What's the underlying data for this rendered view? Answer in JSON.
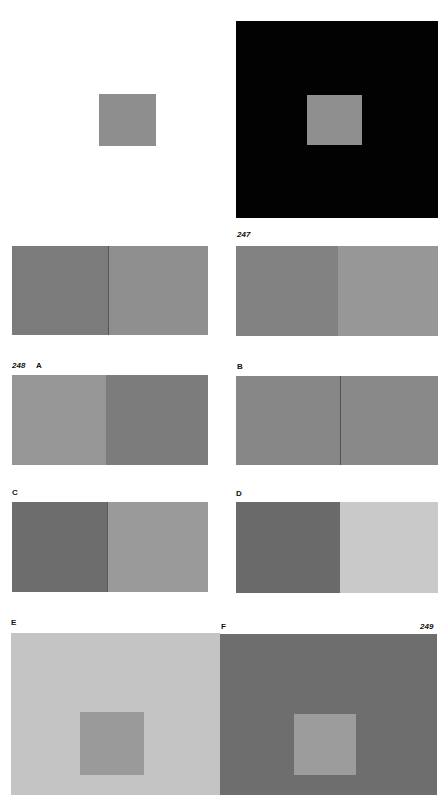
{
  "page_numbers": {
    "p247": "247",
    "p248": "248",
    "p249": "249"
  },
  "labels": {
    "A": "A",
    "B": "B",
    "C": "C",
    "D": "D",
    "E": "E",
    "F": "F"
  },
  "figures": {
    "top_left": {
      "background": "#ffffff",
      "square": "#8e8e8e"
    },
    "top_right": {
      "background": "#020202",
      "square": "#8f8f8f"
    },
    "row1_left": {
      "left": "#7b7b7b",
      "right": "#8f8f8f"
    },
    "row1_right": {
      "left": "#828282",
      "right": "#979797"
    },
    "A": {
      "left": "#969696",
      "right": "#7c7c7c"
    },
    "B": {
      "left": "#878787",
      "right": "#898989"
    },
    "C": {
      "left": "#6d6d6d",
      "right": "#9a9a9a"
    },
    "D": {
      "left": "#6a6a6a",
      "right": "#c9c9c9"
    },
    "E": {
      "background": "#c4c4c4",
      "square": "#9a9a9a"
    },
    "F": {
      "background": "#6e6e6e",
      "square": "#9c9c9c"
    }
  }
}
